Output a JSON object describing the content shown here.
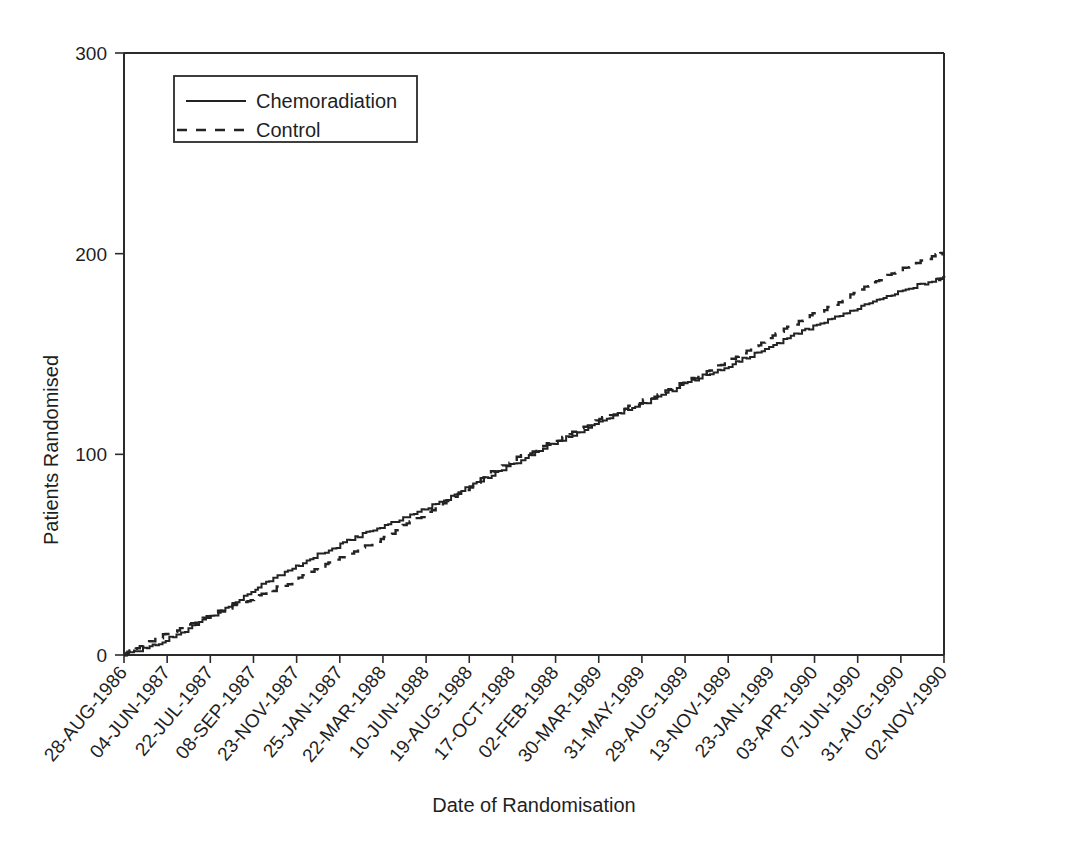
{
  "chart_data": {
    "type": "line",
    "title": "",
    "xlabel": "Date of Randomisation",
    "ylabel": "Patients Randomised",
    "ylim": [
      0,
      300
    ],
    "yticks": [
      0,
      100,
      200,
      300
    ],
    "ytick_labels": [
      "0",
      "100",
      "200",
      "300"
    ],
    "grid": false,
    "legend_position": "top-left-inside",
    "x_tick_labels": [
      "28-AUG-1986",
      "04-JUN-1987",
      "22-JUL-1987",
      "08-SEP-1987",
      "23-NOV-1987",
      "25-JAN-1987",
      "22-MAR-1988",
      "10-JUN-1988",
      "19-AUG-1988",
      "17-OCT-1988",
      "02-FEB-1988",
      "30-MAR-1989",
      "31-MAY-1989",
      "29-AUG-1989",
      "13-NOV-1989",
      "23-JAN-1989",
      "03-APR-1990",
      "07-JUN-1990",
      "31-AUG-1990",
      "02-NOV-1990"
    ],
    "series": [
      {
        "name": "Chemoradiation",
        "style": "solid",
        "x": [
          0,
          0.3,
          0.8,
          1.4,
          2.0,
          2.6,
          3.2,
          3.8,
          4.4,
          5.0,
          5.6,
          6.2,
          6.8,
          7.4,
          8.0,
          8.6,
          9.2,
          9.8,
          10.4,
          11.0,
          11.6,
          12.2,
          12.8,
          13.4,
          14.0,
          14.6,
          15.2,
          15.8,
          16.4,
          17.0,
          17.6,
          18.2,
          18.8,
          19.0
        ],
        "values": [
          0,
          2,
          6,
          12,
          19,
          27,
          35,
          42,
          49,
          55,
          61,
          66,
          71,
          77,
          84,
          91,
          97,
          104,
          110,
          116,
          122,
          127,
          133,
          139,
          144,
          150,
          156,
          162,
          168,
          173,
          178,
          183,
          187,
          188
        ]
      },
      {
        "name": "Control",
        "style": "dashed",
        "x": [
          0,
          0.3,
          0.8,
          1.4,
          2.0,
          2.6,
          3.2,
          3.8,
          4.4,
          5.0,
          5.6,
          6.2,
          6.8,
          7.4,
          8.0,
          8.6,
          9.2,
          9.8,
          10.4,
          11.0,
          11.6,
          12.2,
          12.8,
          13.4,
          14.0,
          14.6,
          15.2,
          15.8,
          16.4,
          17.0,
          17.6,
          18.2,
          18.8,
          19.0
        ],
        "values": [
          0,
          4,
          9,
          14,
          20,
          25,
          30,
          36,
          42,
          48,
          54,
          61,
          68,
          76,
          84,
          92,
          99,
          105,
          111,
          117,
          123,
          128,
          134,
          140,
          147,
          154,
          161,
          168,
          174,
          181,
          188,
          194,
          199,
          200
        ]
      }
    ],
    "legend": [
      {
        "label": "Chemoradiation",
        "style": "solid"
      },
      {
        "label": "Control",
        "style": "dashed"
      }
    ]
  }
}
